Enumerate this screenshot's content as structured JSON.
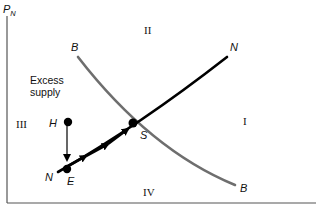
{
  "diagram": {
    "y_axis_label": "P",
    "y_axis_label_subscript": "N",
    "curves": {
      "b_curve": {
        "label_top": "B",
        "label_bottom": "B",
        "color": "#6e6e6e"
      },
      "n_curve": {
        "label_top": "N",
        "label_bottom": "N",
        "color": "#000000"
      }
    },
    "points": {
      "s": "S",
      "h": "H",
      "e": "E"
    },
    "regions": {
      "r1": "I",
      "r2": "II",
      "r3": "III",
      "r4": "IV"
    },
    "annotation": {
      "line1": "Excess",
      "line2": "supply"
    },
    "colors": {
      "axis": "#555555",
      "b_curve": "#6e6e6e",
      "n_curve": "#000000",
      "points": "#000000"
    }
  }
}
